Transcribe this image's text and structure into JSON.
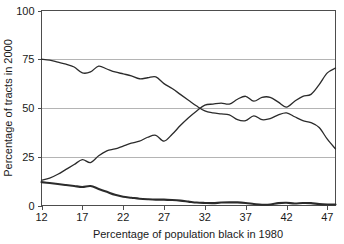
{
  "chart_data": {
    "type": "line",
    "title": "",
    "xlabel": "Percentage of population black in 1980",
    "ylabel": "Percentage of tracts in 2000",
    "xlim": [
      12,
      48
    ],
    "ylim": [
      0,
      100
    ],
    "xticks": [
      12,
      17,
      22,
      27,
      32,
      37,
      42,
      47
    ],
    "xtick_labels": [
      "12",
      "17",
      "22",
      "27",
      "32",
      "37",
      "42",
      "47"
    ],
    "yticks": [
      0,
      25,
      50,
      75,
      100
    ],
    "ytick_labels": [
      "0",
      "25",
      "50",
      "75",
      "100"
    ],
    "grid": "horizontal",
    "gridlines_at": [
      25,
      50,
      75
    ],
    "legend": "none",
    "legend_position": "none",
    "colors": {
      "line": "#2b2b2b",
      "grid": "#b4b4b4",
      "frame": "#4d4d4d",
      "background": "#ffffff"
    },
    "x": [
      12,
      13,
      14,
      15,
      16,
      17,
      18,
      19,
      20,
      21,
      22,
      23,
      24,
      25,
      26,
      27,
      28,
      29,
      30,
      31,
      32,
      33,
      34,
      35,
      36,
      37,
      38,
      39,
      40,
      41,
      42,
      43,
      44,
      45,
      46,
      47,
      48
    ],
    "series": [
      {
        "name": "declining-upper-curve",
        "style": "thin",
        "values": [
          75,
          74.5,
          73.5,
          72.5,
          71,
          68,
          68.5,
          71.5,
          70,
          68.5,
          67.5,
          66.5,
          65,
          65.5,
          66,
          62.5,
          60,
          57,
          54,
          51,
          48.5,
          47.5,
          47,
          46.5,
          44,
          43.5,
          46,
          44,
          44.5,
          46.5,
          47.5,
          45.5,
          43.5,
          42.5,
          40,
          34,
          29
        ]
      },
      {
        "name": "rising-curve",
        "style": "thin",
        "values": [
          13,
          14,
          16,
          18.5,
          21,
          23.5,
          22,
          25.5,
          28,
          29,
          30.5,
          32,
          33,
          35,
          36,
          33,
          36.5,
          41,
          45,
          48.5,
          51.5,
          52,
          52.5,
          52,
          54.5,
          56,
          53.5,
          55.5,
          55.5,
          53,
          50.5,
          53.5,
          56,
          57,
          62,
          68,
          70.5
        ]
      },
      {
        "name": "low-declining-curve",
        "style": "thick",
        "values": [
          12,
          11.5,
          11,
          10.5,
          10,
          9.5,
          10,
          8.5,
          7,
          5.5,
          4.5,
          4,
          3.5,
          3.2,
          3,
          3,
          2.8,
          2.5,
          2,
          1.5,
          1.3,
          1.2,
          1.5,
          1.6,
          1.6,
          1.3,
          0.8,
          0.4,
          0.5,
          1.2,
          1.4,
          1.0,
          1.3,
          1.2,
          0.7,
          0.5,
          0.5
        ]
      }
    ]
  }
}
